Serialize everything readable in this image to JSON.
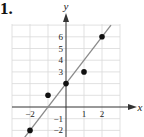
{
  "problem_label": "1.",
  "chart_data": {
    "type": "scatter",
    "title": "",
    "xlabel": "x",
    "ylabel": "y",
    "x_ticks": [
      -2,
      1,
      2
    ],
    "y_ticks": [
      -2,
      -1,
      3,
      4,
      5,
      6
    ],
    "xlim": [
      -2.6,
      2.5
    ],
    "ylim": [
      -2.6,
      7
    ],
    "grid": true,
    "points": [
      {
        "x": -2,
        "y": -2
      },
      {
        "x": -1,
        "y": 1
      },
      {
        "x": 0,
        "y": 2
      },
      {
        "x": 1,
        "y": 3
      },
      {
        "x": 2,
        "y": 6
      }
    ],
    "fit_line": {
      "slope": 2,
      "intercept": 2,
      "x_range": [
        -2.3,
        2.5
      ]
    },
    "colors": {
      "points": "#111111",
      "line": "#8a8a8a",
      "grid": "#d9d9d9",
      "axes": "#333333"
    }
  }
}
